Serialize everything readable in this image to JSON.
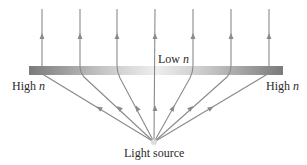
{
  "diagram": {
    "labels": {
      "low_text": "Low",
      "high_text": "High",
      "n_symbol": "n",
      "source": "Light source"
    },
    "colors": {
      "ray": "#8a8a8a",
      "bar_edge": "#7a7a7a",
      "bar_center": "#f0f0f0",
      "text": "#2a2a2a"
    },
    "ray_count": 7
  }
}
